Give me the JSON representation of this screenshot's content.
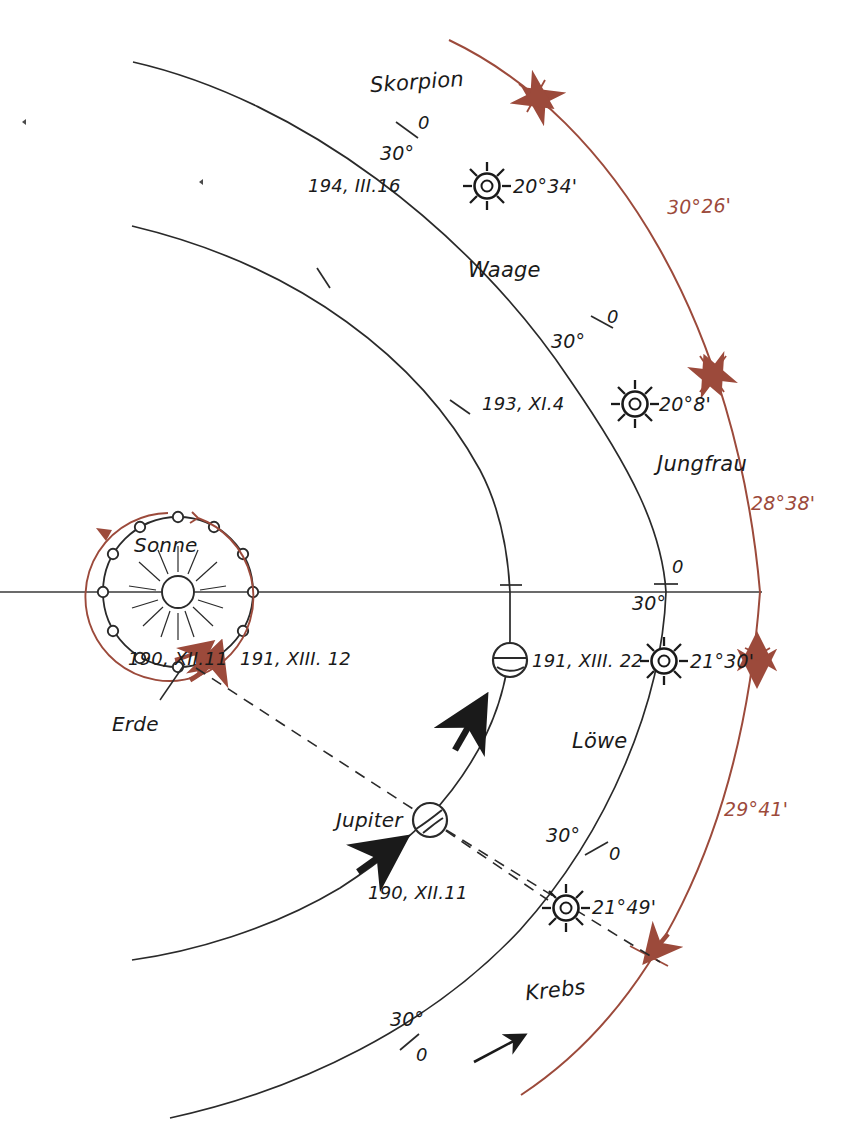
{
  "figure": {
    "type": "astronomical-diagram",
    "colors": {
      "ink": "#1a1a1a",
      "accent_red": "#9c4a3b",
      "background": "#ffffff"
    }
  },
  "bodies": {
    "sun": {
      "label": "Sonne",
      "symbol": "radiant-star"
    },
    "earth": {
      "label": "Erde",
      "symbol": "small-circle"
    },
    "jupiter": {
      "label": "Jupiter",
      "symbol": "banded-circle"
    }
  },
  "zodiac": [
    {
      "name": "Skorpion"
    },
    {
      "name": "Waage"
    },
    {
      "name": "Jungfrau"
    },
    {
      "name": "Löwe"
    },
    {
      "name": "Krebs"
    }
  ],
  "sun_positions": [
    {
      "date": "194, III.16",
      "value": "20°34'",
      "sign": "Skorpion"
    },
    {
      "date": "193, XI.4",
      "value": "20°8'",
      "sign": "Jungfrau"
    },
    {
      "date": "",
      "value": "21°30'",
      "sign": "Löwe"
    },
    {
      "date": "",
      "value": "21°49'",
      "sign": "Krebs"
    }
  ],
  "jupiter_positions": [
    {
      "date": "191, XIII. 22"
    },
    {
      "date": "190, XII.11"
    }
  ],
  "earth_positions": [
    {
      "date": "190, XII.11"
    },
    {
      "date": "191, XIII. 12"
    }
  ],
  "red_arc_measures": [
    {
      "value": "30°26'"
    },
    {
      "value": "28°38'"
    },
    {
      "value": "29°41'"
    }
  ],
  "scale_ticks": [
    {
      "zero": "0",
      "thirty": "30°",
      "sign": "Skorpion"
    },
    {
      "zero": "0",
      "thirty": "30°",
      "sign": "Waage"
    },
    {
      "zero": "0",
      "thirty": "30°",
      "sign": "Jungfrau"
    },
    {
      "zero": "0",
      "thirty": "30°",
      "sign": "Löwe"
    },
    {
      "zero": "0",
      "thirty": "30°",
      "sign": "Krebs"
    }
  ]
}
